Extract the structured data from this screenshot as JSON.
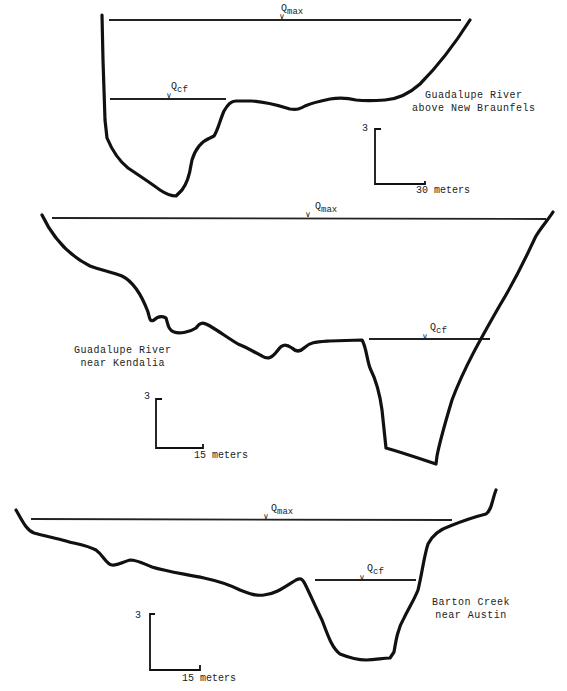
{
  "figure": {
    "type": "river channel cross-sections",
    "panels": [
      {
        "id": "guadalupe-new-braunfels",
        "label_line1": "Guadalupe River",
        "label_line2": "above New Braunfels",
        "water_levels": {
          "max": "Q",
          "max_sub": "max",
          "cf": "Q",
          "cf_sub": "cf"
        },
        "scale": {
          "vertical": "3",
          "horizontal": "30 meters"
        }
      },
      {
        "id": "guadalupe-kendalia",
        "label_line1": "Guadalupe River",
        "label_line2": "near Kendalia",
        "water_levels": {
          "max": "Q",
          "max_sub": "max",
          "cf": "Q",
          "cf_sub": "cf"
        },
        "scale": {
          "vertical": "3",
          "horizontal": "15 meters"
        }
      },
      {
        "id": "barton-creek-austin",
        "label_line1": "Barton Creek",
        "label_line2": "near Austin",
        "water_levels": {
          "max": "Q",
          "max_sub": "max",
          "cf": "Q",
          "cf_sub": "cf"
        },
        "scale": {
          "vertical": "3",
          "horizontal": "15 meters"
        }
      }
    ],
    "colors": {
      "ink": "#111111",
      "background": "#ffffff"
    }
  }
}
